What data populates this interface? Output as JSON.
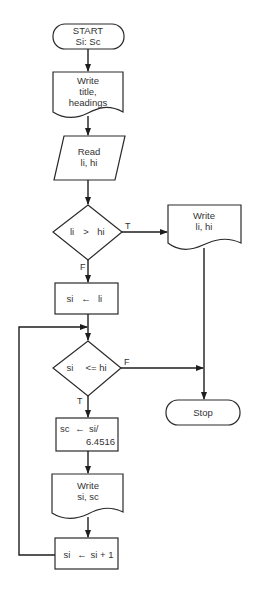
{
  "flowchart": {
    "start": {
      "line1": "START",
      "line2": "Si: Sc"
    },
    "write_headings": {
      "line1": "Write",
      "line2": "title,",
      "line3": "headings"
    },
    "read": {
      "line1": "Read",
      "line2": "li, hi"
    },
    "decision1": {
      "left": "li",
      "op": ">",
      "right": "hi",
      "true_label": "T",
      "false_label": "F"
    },
    "write_limits": {
      "line1": "Write",
      "line2": "li,  hi"
    },
    "assign_si": {
      "left": "si",
      "arrow": "←",
      "right": "li"
    },
    "decision2": {
      "left": "si",
      "op": "<= hi",
      "true_label": "T",
      "false_label": "F"
    },
    "stop": {
      "label": "Stop"
    },
    "compute_sc": {
      "left": "sc",
      "arrow": "←",
      "right": "si/",
      "line2": "6.4516"
    },
    "write_values": {
      "line1": "Write",
      "line2": "si, sc"
    },
    "increment": {
      "left": "si",
      "arrow": "←",
      "right": "si + 1"
    }
  },
  "colors": {
    "stroke": "#2a2a2a",
    "text": "#333333",
    "background": "#ffffff"
  }
}
